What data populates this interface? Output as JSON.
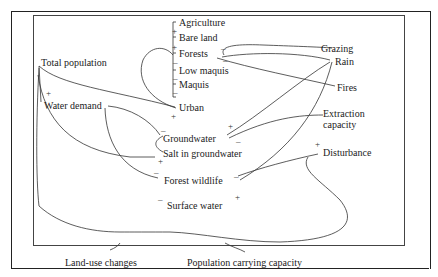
{
  "diagram": {
    "type": "causal-loop",
    "nodes": {
      "agriculture": "Agriculture",
      "bare_land": "Bare land",
      "forests": "Forests",
      "low_maquis": "Low maquis",
      "maquis": "Maquis",
      "urban": "Urban",
      "total_population": "Total population",
      "water_demand": "Water demand",
      "groundwater": "Groundwater",
      "salt_in_groundwater": "Salt in groundwater",
      "forest_wildlife": "Forest wildlife",
      "surface_water": "Surface water",
      "grazing": "Grazing",
      "rain": "Rain",
      "fires": "Fires",
      "extraction_capacity_line1": "Extraction",
      "extraction_capacity_line2": "capacity",
      "disturbance": "Disturbance",
      "land_use_changes": "Land-use changes",
      "population_carrying_capacity": "Population carrying capacity"
    },
    "signs": {
      "plus": "+",
      "minus": "–"
    }
  }
}
